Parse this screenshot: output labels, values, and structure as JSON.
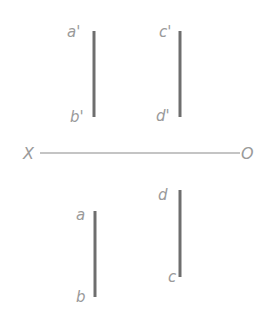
{
  "diagram": {
    "type": "orthographic-projection",
    "axis": {
      "left_label": "X",
      "right_label": "O",
      "y": 153,
      "x1": 40,
      "x2": 240,
      "color": "#8a8a8a"
    },
    "segment_color": "#6e6e6e",
    "label_color": "#9a9a9a",
    "segments": [
      {
        "id": "a-prime-b-prime",
        "view": "front",
        "x": 94,
        "y1": 31,
        "y2": 117,
        "top_label": "a'",
        "bottom_label": "b'"
      },
      {
        "id": "c-prime-d-prime",
        "view": "front",
        "x": 180,
        "y1": 31,
        "y2": 117,
        "top_label": "c'",
        "bottom_label": "d'"
      },
      {
        "id": "a-b",
        "view": "top",
        "x": 95,
        "y1": 211,
        "y2": 297,
        "top_label": "a",
        "bottom_label": "b"
      },
      {
        "id": "d-c",
        "view": "top",
        "x": 180,
        "y1": 190,
        "y2": 277,
        "top_label": "d",
        "bottom_label": "c"
      }
    ]
  }
}
